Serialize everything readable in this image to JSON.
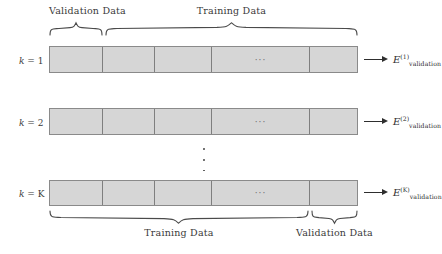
{
  "figure": {
    "colors": {
      "segment_fill": "#d6d6d6",
      "segment_stroke": "#8a8a8a",
      "divider_stroke": "#7f7f7f",
      "text": "#3a3a3a",
      "arrow": "#2e2e2e",
      "brace": "#4a4a4a"
    },
    "ellipsis": "···"
  },
  "top_braces": [
    {
      "label": "Validation Data",
      "span_start": 49,
      "span_end": 103
    },
    {
      "label": "Training Data",
      "span_start": 105,
      "span_end": 358
    }
  ],
  "bottom_braces": [
    {
      "label": "Training Data",
      "span_start": 49,
      "span_end": 309
    },
    {
      "label": "Validation Data",
      "span_start": 311,
      "span_end": 358
    }
  ],
  "rows": [
    {
      "row_label_prefix": "k",
      "row_label_eq": "=",
      "row_label_value": "1",
      "error_base": "E",
      "error_superscript": "(1)",
      "error_subscript": "validation",
      "ellipsis": "···"
    },
    {
      "row_label_prefix": "k",
      "row_label_eq": "=",
      "row_label_value": "2",
      "error_base": "E",
      "error_superscript": "(2)",
      "error_subscript": "validation",
      "ellipsis": "···"
    },
    {
      "row_label_prefix": "k",
      "row_label_eq": "=",
      "row_label_value": "K",
      "error_base": "E",
      "error_superscript": "(K)",
      "error_subscript": "validation",
      "ellipsis": "···"
    }
  ],
  "segment_boundaries": [
    49,
    103,
    155,
    212,
    310,
    358
  ],
  "vertical_dots": {
    "count": 3
  }
}
